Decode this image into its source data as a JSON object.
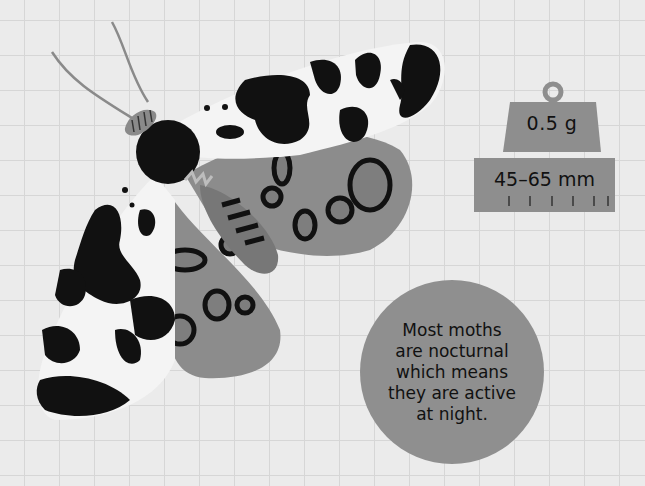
{
  "illustration": {
    "subject": "moth",
    "icon": "moth-illustration",
    "colors": {
      "background": "#ebebeb",
      "grid": "#d6d6d6",
      "wing_white": "#f4f4f4",
      "wing_black": "#111111",
      "hindwing_gray": "#8a8a8a",
      "badge_gray": "#8e8e8e"
    }
  },
  "weight": {
    "icon": "weight-icon",
    "label": "0.5 g"
  },
  "size": {
    "icon": "ruler-icon",
    "label": "45–65 mm"
  },
  "fact": {
    "lines": [
      "Most moths",
      "are nocturnal",
      "which means",
      "they are active",
      "at night."
    ]
  }
}
